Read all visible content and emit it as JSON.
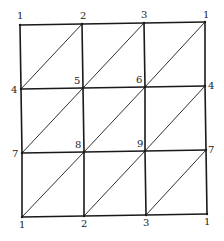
{
  "diagram": {
    "colors": {
      "edge": "#1a1a1a",
      "diagonal": "#1a1a1a",
      "label": "#222222",
      "background": "#ffffff"
    },
    "grid": {
      "rows": [
        {
          "y_labels": [
            {
              "label": "1",
              "x": 20,
              "y": 25,
              "lx": 17,
              "ly": 19
            },
            {
              "label": "2",
              "x": 82,
              "y": 24,
              "lx": 80,
              "ly": 19
            },
            {
              "label": "3",
              "x": 144,
              "y": 23,
              "lx": 141,
              "ly": 18
            },
            {
              "label": "1",
              "x": 205,
              "y": 22,
              "lx": 203,
              "ly": 18
            }
          ]
        },
        {
          "y_labels": [
            {
              "label": "4",
              "x": 21,
              "y": 89,
              "lx": 11,
              "ly": 93
            },
            {
              "label": "5",
              "x": 83,
              "y": 88,
              "lx": 74,
              "ly": 84
            },
            {
              "label": "6",
              "x": 145,
              "y": 87,
              "lx": 136,
              "ly": 83
            },
            {
              "label": "4",
              "x": 205,
              "y": 86,
              "lx": 208,
              "ly": 89
            }
          ]
        },
        {
          "y_labels": [
            {
              "label": "7",
              "x": 22,
              "y": 153,
              "lx": 12,
              "ly": 157
            },
            {
              "label": "8",
              "x": 84,
              "y": 152,
              "lx": 75,
              "ly": 148
            },
            {
              "label": "9",
              "x": 145,
              "y": 151,
              "lx": 137,
              "ly": 147
            },
            {
              "label": "7",
              "x": 206,
              "y": 150,
              "lx": 208,
              "ly": 153
            }
          ]
        },
        {
          "y_labels": [
            {
              "label": "1",
              "x": 22,
              "y": 217,
              "lx": 19,
              "ly": 228
            },
            {
              "label": "2",
              "x": 84,
              "y": 216,
              "lx": 81,
              "ly": 227
            },
            {
              "label": "3",
              "x": 146,
              "y": 215,
              "lx": 143,
              "ly": 226
            },
            {
              "label": "1",
              "x": 207,
              "y": 214,
              "lx": 204,
              "ly": 225
            }
          ]
        }
      ]
    },
    "vertex_labels": [
      "1",
      "2",
      "3",
      "1",
      "4",
      "5",
      "6",
      "4",
      "7",
      "8",
      "9",
      "7",
      "1",
      "2",
      "3",
      "1"
    ]
  }
}
